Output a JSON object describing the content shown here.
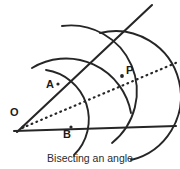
{
  "figure": {
    "caption": "Bisecting an angle",
    "stroke_color": "#262626",
    "label_color": "#1a1a1a",
    "background_color": "#ffffff",
    "labels": {
      "vertex": "O",
      "point_on_upper_ray": "A",
      "point_on_lower_ray": "B",
      "bisector_point": "P"
    },
    "geometry": {
      "vertex": {
        "x": 23,
        "y": 127
      },
      "lower_ray_end": {
        "x": 176,
        "y": 127
      },
      "upper_ray_end": {
        "x": 152,
        "y": 5
      },
      "bisector_end": {
        "x": 178,
        "y": 62
      },
      "point_A": {
        "x": 58,
        "y": 84
      },
      "point_B": {
        "x": 71,
        "y": 127
      },
      "point_P": {
        "x": 122,
        "y": 76
      },
      "arc_radius_from_vertex": 49,
      "arc_radius_from_A_and_B": 65
    }
  }
}
